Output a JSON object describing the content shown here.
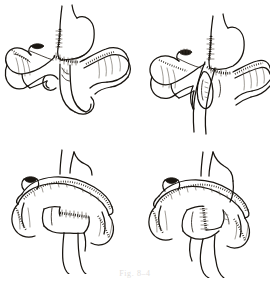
{
  "figure": {
    "background_color": "#ffffff",
    "ink_color": "#18140f",
    "style": "pen-and-ink medical line drawing",
    "panel_count": 4,
    "caption": "Fig.  8–4",
    "caption_color": "#e2e0dd",
    "panels": [
      {
        "id": "panel-tl",
        "position": "top-left",
        "label": "A",
        "description": "Stomach with sutured gastric remnant and small-bowel loops arranged beneath",
        "structures": [
          "stomach",
          "gastric-suture-line",
          "duodenal-stump",
          "jejunal-loop",
          "mesentery",
          "transverse-colon"
        ]
      },
      {
        "id": "panel-tr",
        "position": "top-right",
        "label": "B",
        "description": "Retrocolic limb brought up to the stomach behind the transverse colon",
        "structures": [
          "stomach",
          "retrocolic-limb",
          "mesenteric-window",
          "transverse-colon",
          "duodenal-stump",
          "suture-line"
        ]
      },
      {
        "id": "panel-bl",
        "position": "bottom-left",
        "label": "C",
        "description": "Transverse colon reflected upward exposing the completed entero-enterostomy",
        "structures": [
          "transverse-colon",
          "transverse-mesocolon",
          "entero-enterostomy-suture-line",
          "appendiceal-stump",
          "efferent-limb",
          "afferent-limb"
        ]
      },
      {
        "id": "panel-br",
        "position": "bottom-right",
        "label": "D",
        "description": "Completed reconstruction with vertical anastomotic suture line and closed mesenteric defect",
        "structures": [
          "transverse-colon",
          "transverse-mesocolon",
          "vertical-anastomosis-suture-line",
          "appendiceal-stump",
          "jejunal-limbs",
          "closed-mesenteric-defect"
        ]
      }
    ]
  }
}
